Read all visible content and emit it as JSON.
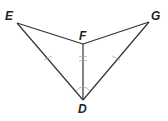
{
  "figure": {
    "type": "geometry-diagram",
    "points": {
      "E": {
        "label": "E",
        "x": 17,
        "y": 23
      },
      "F": {
        "label": "F",
        "x": 83,
        "y": 44
      },
      "G": {
        "label": "G",
        "x": 149,
        "y": 22
      },
      "D": {
        "label": "D",
        "x": 83,
        "y": 100
      }
    },
    "segments": [
      "ED",
      "EF",
      "FG",
      "GD",
      "FD"
    ],
    "marks": {
      "congruent_segments": [
        "ED",
        "GD"
      ],
      "bisector": "FD",
      "congruent_angles": [
        "EDF",
        "FDG"
      ]
    }
  }
}
